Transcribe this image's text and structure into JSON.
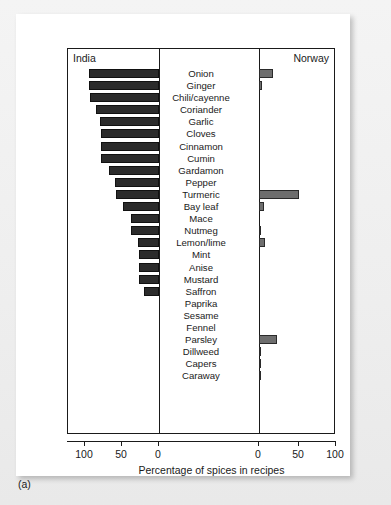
{
  "figure": {
    "panel_letter": "(a)",
    "left_group_title": "India",
    "right_group_title": "Norway",
    "xaxis_title": "Percentage of spices in recipes",
    "tick_labels_left": [
      "100",
      "50",
      "0"
    ],
    "tick_labels_right": [
      "0",
      "50",
      "100"
    ],
    "colors": {
      "india_bar": "#2b2b2b",
      "norway_bar": "#6e6e6e",
      "frame": "#1a1a1a",
      "card": "#ffffff",
      "page_background": "#efefef"
    }
  },
  "chart_data": {
    "type": "bar",
    "title": "",
    "subtitle": "",
    "xlabel": "Percentage of spices in recipes",
    "ylabel": "",
    "orientation": "horizontal",
    "layout": "butterfly-diverging-back-to-back",
    "xlim_left": [
      0,
      100
    ],
    "xlim_right": [
      0,
      100
    ],
    "left_axis_direction": "right-to-left",
    "grid": false,
    "legend_position": "top-corners",
    "categories": [
      "Onion",
      "Ginger",
      "Chili/cayenne",
      "Coriander",
      "Garlic",
      "Cloves",
      "Cinnamon",
      "Cumin",
      "Gardamon",
      "Pepper",
      "Turmeric",
      "Bay leaf",
      "Mace",
      "Nutmeg",
      "Lemon/lime",
      "Mint",
      "Anise",
      "Mustard",
      "Saffron",
      "Paprika",
      "Sesame",
      "Fennel",
      "Parsley",
      "Dillweed",
      "Capers",
      "Caraway"
    ],
    "series": [
      {
        "name": "India",
        "side": "left",
        "color": "#2b2b2b",
        "values": [
          95,
          95,
          93,
          85,
          80,
          78,
          78,
          78,
          67,
          60,
          58,
          48,
          38,
          38,
          28,
          27,
          27,
          27,
          20,
          0,
          0,
          0,
          0,
          0,
          0,
          0
        ]
      },
      {
        "name": "Norway",
        "side": "right",
        "color": "#6e6e6e",
        "values": [
          17,
          4,
          0,
          0,
          0,
          0,
          0,
          0,
          0,
          0,
          48,
          6,
          0,
          2,
          7,
          0,
          0,
          0,
          0,
          0,
          0,
          0,
          22,
          3,
          2,
          2
        ]
      }
    ],
    "ticks": [
      0,
      50,
      100
    ]
  }
}
